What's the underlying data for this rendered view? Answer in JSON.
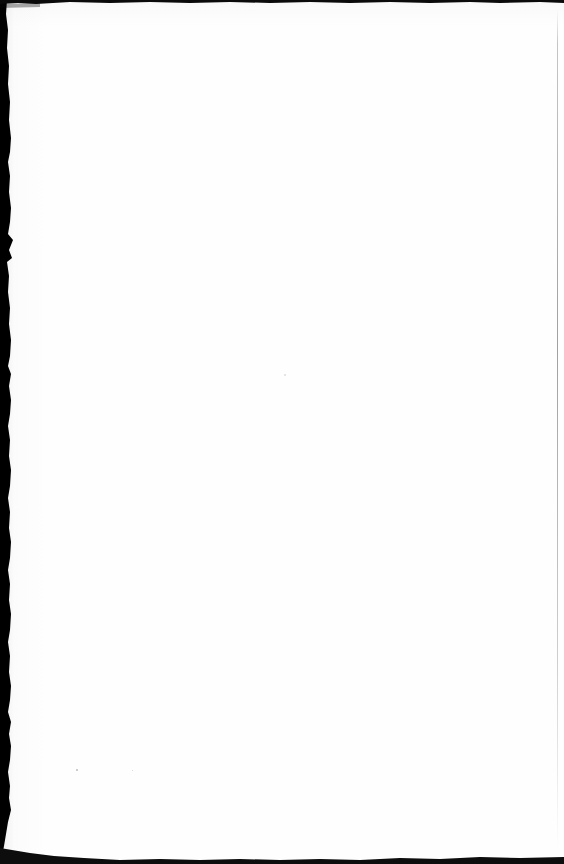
{
  "page": {
    "kind": "scanned-book-page",
    "content_state": "blank",
    "caption": "Blank scanned page",
    "width_px": 564,
    "height_px": 864,
    "paper_color": "#fefefe",
    "ink_color": "#000000"
  },
  "artifacts": {
    "gutter": {
      "label": "left binding gutter shadow",
      "color": "#000000",
      "side": "left",
      "max_width_px": 11
    },
    "top_band": {
      "label": "top scan edge band",
      "color": "#0a0a0a",
      "max_height_px": 4
    },
    "bottom_band": {
      "label": "bottom scan edge band",
      "color": "#0d0d0d",
      "max_height_px": 9
    },
    "right_rule": {
      "label": "right page edge line",
      "color": "#8c8c8c",
      "width_px": 1
    },
    "specks": [
      {
        "label": "speck-upper-body",
        "x": 285,
        "y": 375,
        "r": 0.8,
        "color": "#dcdcdc"
      },
      {
        "label": "speck-lower-left",
        "x": 77,
        "y": 770,
        "r": 1.1,
        "color": "#bdbdbd"
      },
      {
        "label": "speck-lower-mid",
        "x": 133,
        "y": 771,
        "r": 0.7,
        "color": "#d5d5d5"
      }
    ]
  }
}
